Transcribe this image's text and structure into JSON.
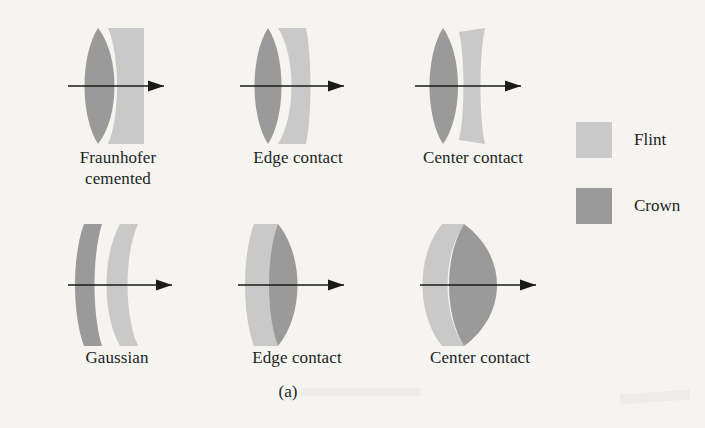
{
  "figure": {
    "caption": "(a)",
    "background_color": "#f5f4f1",
    "axis_color": "#1a1a1a"
  },
  "legend": {
    "items": [
      {
        "label": "Flint",
        "color": "#c9c9c9",
        "swatch_name": "flint-swatch"
      },
      {
        "label": "Crown",
        "color": "#9a9a9a",
        "swatch_name": "crown-swatch"
      }
    ]
  },
  "materials": {
    "flint_color": "#c9c9c9",
    "crown_color": "#9a9a9a"
  },
  "groups": [
    {
      "id": "fraunhofer-cemented",
      "label": "Fraunhofer\ncemented",
      "row": "top",
      "column": 1,
      "front_element": "crown",
      "rear_element": "flint",
      "contact": "cemented"
    },
    {
      "id": "top-edge-contact",
      "label": "Edge contact",
      "row": "top",
      "column": 2,
      "front_element": "crown",
      "rear_element": "flint",
      "contact": "edge"
    },
    {
      "id": "top-center-contact",
      "label": "Center contact",
      "row": "top",
      "column": 3,
      "front_element": "crown",
      "rear_element": "flint",
      "contact": "center"
    },
    {
      "id": "gaussian",
      "label": "Gaussian",
      "row": "bottom",
      "column": 1,
      "front_element": "crown",
      "rear_element": "flint",
      "contact": "separated"
    },
    {
      "id": "bottom-edge-contact",
      "label": "Edge contact",
      "row": "bottom",
      "column": 2,
      "front_element": "flint",
      "rear_element": "crown",
      "contact": "edge"
    },
    {
      "id": "bottom-center-contact",
      "label": "Center contact",
      "row": "bottom",
      "column": 3,
      "front_element": "flint",
      "rear_element": "crown",
      "contact": "center"
    }
  ]
}
